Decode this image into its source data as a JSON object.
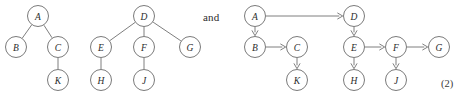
{
  "figure": {
    "width": 468,
    "height": 99,
    "background": "#ffffff",
    "node_radius": 10.5,
    "node_stroke": "#6b6b6b",
    "edge_stroke": "#6f6f6f",
    "label_color": "#2b2b2b"
  },
  "conjunction": {
    "text": "and",
    "x": 203,
    "y": 11
  },
  "equation_number": {
    "text": "(2)",
    "x": 441,
    "y": 78
  },
  "graphs": [
    {
      "id": "undirected-tree-1",
      "name": "forest-tree-a",
      "directed": false,
      "nodes": [
        {
          "id": "A",
          "label": "A",
          "x": 38,
          "y": 16
        },
        {
          "id": "B",
          "label": "B",
          "x": 16,
          "y": 47
        },
        {
          "id": "C",
          "label": "C",
          "x": 58,
          "y": 47
        },
        {
          "id": "K",
          "label": "K",
          "x": 58,
          "y": 80
        }
      ],
      "edges": [
        {
          "from": "A",
          "to": "B"
        },
        {
          "from": "A",
          "to": "C"
        },
        {
          "from": "C",
          "to": "K"
        }
      ]
    },
    {
      "id": "undirected-tree-2",
      "name": "forest-tree-d",
      "directed": false,
      "nodes": [
        {
          "id": "D",
          "label": "D",
          "x": 144,
          "y": 16
        },
        {
          "id": "E",
          "label": "E",
          "x": 101,
          "y": 47
        },
        {
          "id": "F",
          "label": "F",
          "x": 144,
          "y": 47
        },
        {
          "id": "G",
          "label": "G",
          "x": 190,
          "y": 47
        },
        {
          "id": "H",
          "label": "H",
          "x": 101,
          "y": 80
        },
        {
          "id": "J",
          "label": "J",
          "x": 144,
          "y": 80
        }
      ],
      "edges": [
        {
          "from": "D",
          "to": "E"
        },
        {
          "from": "D",
          "to": "F"
        },
        {
          "from": "D",
          "to": "G"
        },
        {
          "from": "E",
          "to": "H"
        },
        {
          "from": "F",
          "to": "J"
        }
      ]
    },
    {
      "id": "directed-graph",
      "name": "directed-acyclic-graph",
      "directed": true,
      "nodes": [
        {
          "id": "A",
          "label": "A",
          "x": 255,
          "y": 16
        },
        {
          "id": "B",
          "label": "B",
          "x": 255,
          "y": 47
        },
        {
          "id": "C",
          "label": "C",
          "x": 297,
          "y": 47
        },
        {
          "id": "K",
          "label": "K",
          "x": 297,
          "y": 80
        },
        {
          "id": "D",
          "label": "D",
          "x": 354,
          "y": 16
        },
        {
          "id": "E",
          "label": "E",
          "x": 354,
          "y": 47
        },
        {
          "id": "F",
          "label": "F",
          "x": 396,
          "y": 47
        },
        {
          "id": "G",
          "label": "G",
          "x": 439,
          "y": 47
        },
        {
          "id": "H",
          "label": "H",
          "x": 354,
          "y": 80
        },
        {
          "id": "J",
          "label": "J",
          "x": 396,
          "y": 80
        }
      ],
      "edges": [
        {
          "from": "A",
          "to": "D"
        },
        {
          "from": "A",
          "to": "B"
        },
        {
          "from": "B",
          "to": "C"
        },
        {
          "from": "C",
          "to": "K"
        },
        {
          "from": "D",
          "to": "E"
        },
        {
          "from": "E",
          "to": "F"
        },
        {
          "from": "E",
          "to": "H"
        },
        {
          "from": "F",
          "to": "G"
        },
        {
          "from": "F",
          "to": "J"
        }
      ]
    }
  ]
}
